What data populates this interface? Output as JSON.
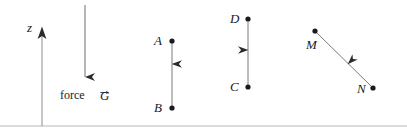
{
  "figure": {
    "title_text": "",
    "width": 407,
    "height": 131,
    "stroke_color": "#2b2b2b",
    "baseline_color": "#b9b9b9",
    "background": "#ffffff"
  },
  "axis": {
    "label": "z",
    "label_x": 28,
    "label_y": 22,
    "line_x": 42,
    "line_top_y": 30,
    "line_bottom_y": 126,
    "direction": "up"
  },
  "force_arrow": {
    "label_word": "force",
    "vector_symbol": "G",
    "line_x": 85,
    "line_top_y": 5,
    "line_bottom_y": 86,
    "direction": "down",
    "word_x": 60,
    "word_y": 90,
    "vector_x": 100,
    "vector_y": 89
  },
  "vectors": [
    {
      "name": "AB",
      "start_label": "A",
      "end_label": "B",
      "start_point": {
        "x": 172,
        "y": 41
      },
      "end_point": {
        "x": 172,
        "y": 108
      },
      "start_label_pos": {
        "x": 154,
        "y": 34
      },
      "end_label_pos": {
        "x": 154,
        "y": 101
      },
      "arrowhead_t": 0.45,
      "direction": "down"
    },
    {
      "name": "CD",
      "start_label": "C",
      "end_label": "D",
      "start_point": {
        "x": 248,
        "y": 87
      },
      "end_point": {
        "x": 248,
        "y": 19
      },
      "start_label_pos": {
        "x": 230,
        "y": 80
      },
      "end_label_pos": {
        "x": 230,
        "y": 12
      },
      "arrowhead_t": 0.62,
      "direction": "up"
    },
    {
      "name": "MN",
      "start_label": "M",
      "end_label": "N",
      "start_point": {
        "x": 315,
        "y": 31
      },
      "end_point": {
        "x": 373,
        "y": 88
      },
      "start_label_pos": {
        "x": 306,
        "y": 38
      },
      "end_label_pos": {
        "x": 357,
        "y": 82
      },
      "arrowhead_t": 0.68,
      "direction": "down-right"
    }
  ],
  "baseline": {
    "y": 126,
    "x_start": 0,
    "x_end": 407
  }
}
